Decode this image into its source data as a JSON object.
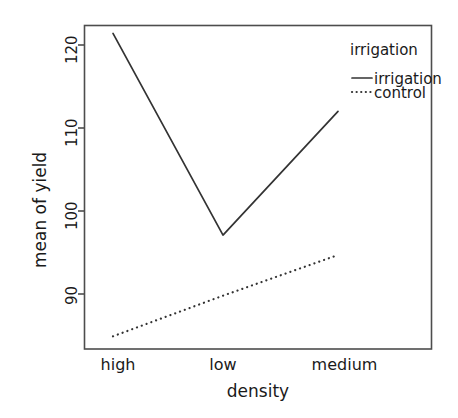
{
  "chart_data": {
    "type": "line",
    "title": "",
    "xlabel": "density",
    "ylabel": "mean of yield",
    "categories": [
      "high",
      "low",
      "medium"
    ],
    "yticks": [
      90,
      100,
      110,
      120
    ],
    "ytick_labels": [
      "90",
      "100",
      "110",
      "120"
    ],
    "ylim": [
      83.0,
      123.0
    ],
    "grid": false,
    "legend_title": "irrigation",
    "legend_position": "top-right inside plot",
    "series": [
      {
        "name": "irrigation",
        "linestyle": "solid",
        "color": "#333333",
        "values": [
          121.4,
          97.1,
          112.0
        ]
      },
      {
        "name": "control",
        "linestyle": "dotted",
        "color": "#333333",
        "values": [
          84.9,
          89.8,
          94.7
        ]
      }
    ]
  },
  "axes": {
    "ylabel_text": "mean of yield",
    "xlabel_text": "density",
    "tick_0": "90",
    "tick_1": "100",
    "tick_2": "110",
    "tick_3": "120",
    "cat_0": "high",
    "cat_1": "low",
    "cat_2": "medium"
  },
  "legend": {
    "title": "irrigation",
    "item_0": "irrigation",
    "item_1": "control"
  },
  "colors": {
    "background": "#ffffff",
    "line": "#333333",
    "frame": "#4d4d4d",
    "text": "#1a1a1a"
  }
}
